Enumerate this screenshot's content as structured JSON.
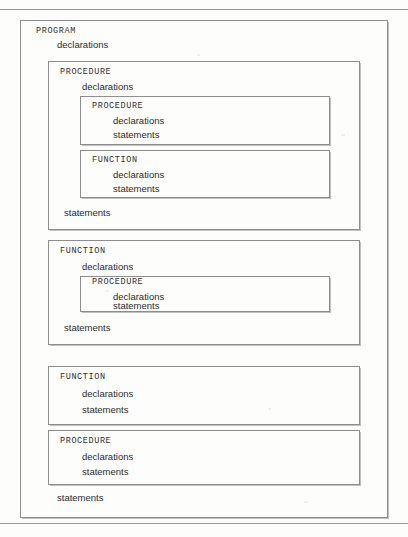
{
  "page": {
    "background_color": "#fdfdfc",
    "border_color": "#8d8d8d",
    "text_color": "#2b2b2b"
  },
  "labels": {
    "program": "PROGRAM",
    "procedure": "PROCEDURE",
    "function": "FUNCTION",
    "declarations": "declarations",
    "statements": "statements"
  },
  "diagram": {
    "type": "nested-scope-blocks",
    "root": {
      "keyword": "PROGRAM",
      "declarations": "declarations",
      "statements": "statements",
      "children": [
        {
          "keyword": "PROCEDURE",
          "declarations": "declarations",
          "statements": "statements",
          "children": [
            {
              "keyword": "PROCEDURE",
              "declarations": "declarations",
              "statements": "statements",
              "children": []
            },
            {
              "keyword": "FUNCTION",
              "declarations": "declarations",
              "statements": "statements",
              "children": []
            }
          ]
        },
        {
          "keyword": "FUNCTION",
          "declarations": "declarations",
          "statements": "statements",
          "children": [
            {
              "keyword": "PROCEDURE",
              "declarations": "declarations",
              "statements": "statements",
              "children": []
            }
          ]
        },
        {
          "keyword": "FUNCTION",
          "declarations": "declarations",
          "statements": "statements",
          "children": []
        },
        {
          "keyword": "PROCEDURE",
          "declarations": "declarations",
          "statements": "statements",
          "children": []
        }
      ]
    }
  }
}
